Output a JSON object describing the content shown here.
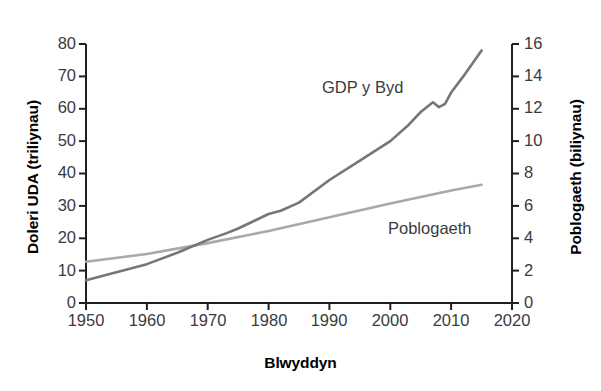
{
  "chart_data": {
    "type": "line",
    "title": "",
    "xlabel": "Blwyddyn",
    "ylabel": "Doleri UDA (triliynau)",
    "ylabel_right": "Poblogaeth (biliynau)",
    "xlim": [
      1950,
      2020
    ],
    "ylim": [
      0,
      80
    ],
    "ylim_right": [
      0,
      16
    ],
    "xticks": [
      1950,
      1960,
      1970,
      1980,
      1990,
      2000,
      2010,
      2020
    ],
    "yticks": [
      0,
      10,
      20,
      30,
      40,
      50,
      60,
      70,
      80
    ],
    "yticks_right": [
      0,
      2,
      4,
      6,
      8,
      10,
      12,
      14,
      16
    ],
    "grid": false,
    "legend": "inline-labels",
    "series": [
      {
        "name": "GDP y Byd",
        "axis": "left",
        "unit": "triliynau USD",
        "color": "#767676",
        "x": [
          1950,
          1955,
          1960,
          1965,
          1970,
          1973,
          1975,
          1980,
          1982,
          1985,
          1990,
          1995,
          2000,
          2003,
          2005,
          2007,
          2008,
          2009,
          2010,
          2012,
          2015
        ],
        "values": [
          7,
          9.5,
          12,
          15.5,
          19.5,
          21.5,
          23,
          27.5,
          28.5,
          31,
          38,
          44,
          50,
          55,
          59,
          62,
          60.5,
          61.5,
          65,
          70,
          78
        ]
      },
      {
        "name": "Poblogaeth",
        "axis": "right",
        "unit": "biliynau",
        "color": "#a9a9a9",
        "x": [
          1950,
          1960,
          1970,
          1980,
          1990,
          2000,
          2010,
          2015
        ],
        "values": [
          2.55,
          3.03,
          3.7,
          4.45,
          5.3,
          6.15,
          6.95,
          7.3
        ]
      }
    ],
    "annotations": [
      {
        "text": "GDP y Byd",
        "x": 1988,
        "y": 63
      },
      {
        "text": "Poblogaeth",
        "x": 2000,
        "y": 23
      }
    ]
  },
  "axes": {
    "x_tick_labels": [
      "1950",
      "1960",
      "1970",
      "1980",
      "1990",
      "2000",
      "2010",
      "2020"
    ],
    "y_left_tick_labels": [
      "80",
      "70",
      "60",
      "50",
      "40",
      "30",
      "20",
      "10",
      "0"
    ],
    "y_right_tick_labels": [
      "16",
      "14",
      "12",
      "10",
      "8",
      "6",
      "4",
      "2",
      "0"
    ],
    "x_title": "Blwyddyn",
    "y_left_title": "Doleri UDA (triliynau)",
    "y_right_title": "Poblogaeth (biliynau)"
  },
  "colors": {
    "gdp_line": "#767676",
    "population_line": "#a9a9a9",
    "axis": "#1f1f1f",
    "background": "#ffffff"
  }
}
